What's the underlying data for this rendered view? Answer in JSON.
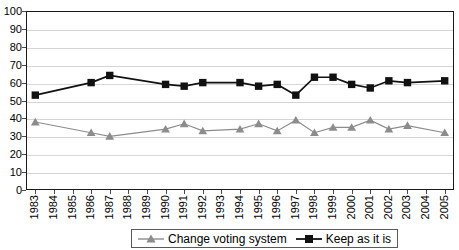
{
  "title_sliver": "",
  "legend": {
    "position": "bottom-center",
    "entries": [
      {
        "label": "Change voting system",
        "marker": "triangle-marker-icon",
        "color": "#8c8c8c"
      },
      {
        "label": "Keep as it is",
        "marker": "square-marker-icon",
        "color": "#111111"
      }
    ]
  },
  "chart_data": {
    "type": "line",
    "title": "",
    "xlabel": "",
    "ylabel": "",
    "ylim": [
      0,
      100
    ],
    "ytick_step": 10,
    "grid": true,
    "yticks": [
      "100",
      "90",
      "80",
      "70",
      "60",
      "50",
      "40",
      "30",
      "20",
      "10",
      "0"
    ],
    "categories": [
      "1983",
      "1984",
      "1985",
      "1986",
      "1987",
      "1988",
      "1989",
      "1990",
      "1991",
      "1992",
      "1993",
      "1994",
      "1995",
      "1996",
      "1997",
      "1998",
      "1999",
      "2000",
      "2001",
      "2002",
      "2003",
      "2004",
      "2005"
    ],
    "series": [
      {
        "name": "Change voting system",
        "color": "#8c8c8c",
        "marker": "triangle",
        "values": [
          38,
          null,
          null,
          32,
          30,
          null,
          null,
          34,
          37,
          33,
          null,
          34,
          37,
          33,
          39,
          32,
          35,
          35,
          39,
          34,
          36,
          null,
          32
        ]
      },
      {
        "name": "Keep as it is",
        "color": "#111111",
        "marker": "square",
        "values": [
          53,
          null,
          null,
          60,
          64,
          null,
          null,
          59,
          58,
          60,
          null,
          60,
          58,
          59,
          53,
          63,
          63,
          59,
          57,
          61,
          60,
          null,
          61
        ]
      }
    ]
  }
}
